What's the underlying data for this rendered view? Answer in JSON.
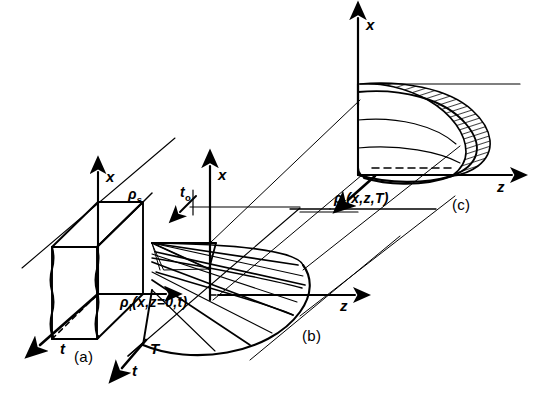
{
  "figure": {
    "background": "#ffffff",
    "ink": "#000000",
    "width": 540,
    "height": 414
  },
  "panels": [
    {
      "id": "a",
      "tag": "(a)",
      "description": "Rectangular slab block in x-z-t axes with wavy front face",
      "axes": [
        {
          "name": "x-axis",
          "label": "x"
        },
        {
          "name": "t-axis",
          "label": "t"
        }
      ],
      "annotations": [
        {
          "name": "rho-s-label",
          "text": "ρ",
          "sub": "s"
        },
        {
          "name": "rho-f-label",
          "text": "ρ",
          "sub": "f",
          "args": "(x,z=0,t)"
        }
      ]
    },
    {
      "id": "b",
      "tag": "(b)",
      "description": "Ruled fan surface sweeping from triangular wedge to curved lobe",
      "axes": [
        {
          "name": "x-axis",
          "label": "x"
        },
        {
          "name": "z-axis",
          "label": "z"
        },
        {
          "name": "t-axis",
          "label": "t"
        }
      ],
      "annotations": [
        {
          "name": "t0-label",
          "text": "t",
          "sub": "o"
        },
        {
          "name": "T-label",
          "text": "T"
        }
      ]
    },
    {
      "id": "c",
      "tag": "(c)",
      "description": "Dome / half-ellipsoid surface with hatched rim band and interior contour lines",
      "axes": [
        {
          "name": "x-axis",
          "label": "x"
        },
        {
          "name": "z-axis",
          "label": "z"
        }
      ],
      "annotations": [
        {
          "name": "rho-f-label",
          "text": "ρ",
          "sub": "f",
          "args": "(x,z,T)"
        }
      ]
    }
  ],
  "labels": {
    "panel_a_tag": "(a)",
    "panel_b_tag": "(b)",
    "panel_c_tag": "(c)",
    "x_axis_a": "x",
    "t_axis_a": "t",
    "rho_s": "ρ",
    "rho_s_sub": "s",
    "rho_f_a": "ρ",
    "rho_f_a_sub": "f",
    "rho_f_a_args": "(x,z=0,t)",
    "x_axis_b": "x",
    "z_axis_b": "z",
    "t_axis_b": "t",
    "T_axis_b": "T",
    "t0": "t",
    "t0_sub": "o",
    "x_axis_c": "x",
    "z_axis_c": "z",
    "rho_f_c": "ρ",
    "rho_f_c_sub": "f",
    "rho_f_c_args": "(x,z,T)"
  }
}
